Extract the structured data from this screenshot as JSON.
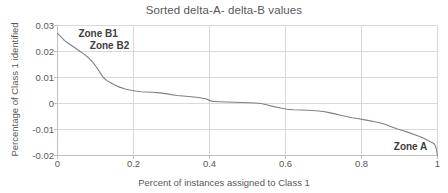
{
  "chart_data": {
    "type": "line",
    "title": "Sorted delta-A- delta-B values",
    "xlabel": "Percent of instances  assigned to Class 1",
    "ylabel": "Percentage of Class 1 identified",
    "xlim": [
      0,
      1
    ],
    "ylim": [
      -0.02,
      0.03
    ],
    "xticks": [
      "0",
      "0.2",
      "0.4",
      "0.6",
      "0.8",
      "1"
    ],
    "xtick_values": [
      0,
      0.2,
      0.4,
      0.6,
      0.8,
      1
    ],
    "yticks": [
      "0.03",
      "0.02",
      "0.01",
      "0",
      "-0.01",
      "-0.02"
    ],
    "ytick_values": [
      0.03,
      0.02,
      0.01,
      0,
      -0.01,
      -0.02
    ],
    "grid": true,
    "legend": "none",
    "line_color": "#808080",
    "series": [
      {
        "name": "delta-A minus delta-B",
        "x": [
          0.0,
          0.008,
          0.018,
          0.03,
          0.042,
          0.055,
          0.068,
          0.08,
          0.092,
          0.1,
          0.108,
          0.115,
          0.122,
          0.13,
          0.14,
          0.152,
          0.165,
          0.178,
          0.19,
          0.205,
          0.22,
          0.235,
          0.25,
          0.262,
          0.275,
          0.288,
          0.3,
          0.315,
          0.33,
          0.345,
          0.36,
          0.375,
          0.39,
          0.4,
          0.41,
          0.425,
          0.445,
          0.465,
          0.485,
          0.505,
          0.52,
          0.535,
          0.55,
          0.57,
          0.59,
          0.605,
          0.62,
          0.64,
          0.66,
          0.68,
          0.7,
          0.715,
          0.73,
          0.745,
          0.76,
          0.775,
          0.79,
          0.805,
          0.82,
          0.835,
          0.85,
          0.865,
          0.88,
          0.895,
          0.91,
          0.925,
          0.94,
          0.955,
          0.965,
          0.975,
          0.982,
          0.988,
          0.993,
          0.997,
          1.0
        ],
        "y": [
          0.027,
          0.0258,
          0.0243,
          0.023,
          0.0218,
          0.0205,
          0.0192,
          0.0178,
          0.016,
          0.0145,
          0.0128,
          0.0112,
          0.0098,
          0.0088,
          0.008,
          0.007,
          0.0062,
          0.0056,
          0.0052,
          0.0048,
          0.0045,
          0.0044,
          0.0043,
          0.0042,
          0.004,
          0.0037,
          0.0034,
          0.0031,
          0.0029,
          0.0027,
          0.0025,
          0.0022,
          0.0018,
          0.0012,
          0.0008,
          0.0007,
          0.0006,
          0.0005,
          0.0004,
          0.0003,
          0.0002,
          0.0,
          -0.0005,
          -0.0012,
          -0.0018,
          -0.0022,
          -0.0024,
          -0.0025,
          -0.0026,
          -0.0028,
          -0.0031,
          -0.0035,
          -0.004,
          -0.0045,
          -0.005,
          -0.0055,
          -0.0058,
          -0.0062,
          -0.0066,
          -0.007,
          -0.0075,
          -0.0082,
          -0.009,
          -0.0098,
          -0.0105,
          -0.0112,
          -0.012,
          -0.0128,
          -0.0135,
          -0.0142,
          -0.0148,
          -0.0152,
          -0.0158,
          -0.0175,
          -0.02
        ]
      }
    ],
    "annotations": [
      {
        "text": "Zone B1",
        "x": 0.055,
        "y": 0.0268
      },
      {
        "text": "Zone B2",
        "x": 0.085,
        "y": 0.0222
      },
      {
        "text": "Zone A",
        "x": 0.885,
        "y": -0.0168
      }
    ]
  }
}
